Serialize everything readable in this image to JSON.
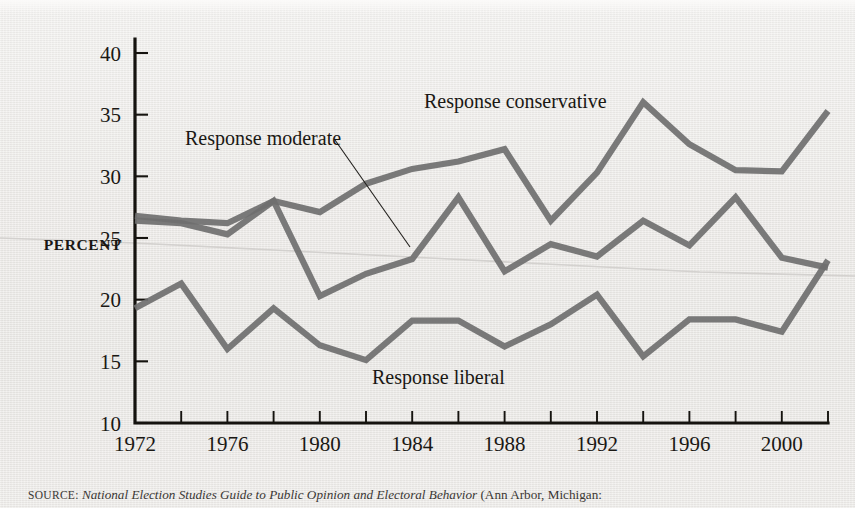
{
  "figure": {
    "axis_title_y": "PERCENT",
    "background_color": "#ebeae7",
    "line_color": "#6f6f6f",
    "axis_color": "#15130f"
  },
  "caption": {
    "source_word": "SOURCE:",
    "title": "National Election Studies Guide to Public Opinion and Electoral Behavior",
    "rest": "(Ann Arbor, Michigan:"
  },
  "labels": {
    "conservative": "Response conservative",
    "moderate": "Response moderate",
    "liberal": "Response liberal"
  },
  "chart_data": {
    "type": "line",
    "title": "",
    "xlabel": "",
    "ylabel": "PERCENT",
    "xlim": [
      1972,
      2002
    ],
    "ylim": [
      10,
      40
    ],
    "ytick_labels": [
      "10",
      "15",
      "20",
      "25",
      "30",
      "35",
      "40"
    ],
    "yticks": [
      10,
      15,
      20,
      25,
      30,
      35,
      40
    ],
    "xtick_labels": [
      "1972",
      "1976",
      "1980",
      "1984",
      "1988",
      "1992",
      "1996",
      "2000"
    ],
    "xticks_labeled": [
      1972,
      1976,
      1980,
      1984,
      1988,
      1992,
      1996,
      2000
    ],
    "xticks_minor": [
      1974,
      1978,
      1982,
      1986,
      1990,
      1994,
      1998,
      2002
    ],
    "grid": false,
    "legend": "inline-annotations",
    "x": [
      1972,
      1974,
      1976,
      1978,
      1980,
      1982,
      1984,
      1986,
      1988,
      1990,
      1992,
      1994,
      1996,
      1998,
      2000,
      2002
    ],
    "series": [
      {
        "name": "Response conservative",
        "values": [
          26.8,
          26.4,
          26.2,
          28.0,
          27.1,
          29.4,
          30.6,
          31.2,
          32.2,
          26.4,
          30.3,
          36.0,
          32.6,
          30.5,
          30.4,
          35.3
        ]
      },
      {
        "name": "Response moderate",
        "values": [
          26.4,
          26.2,
          25.3,
          28.0,
          20.3,
          22.1,
          23.3,
          28.3,
          22.3,
          24.5,
          23.5,
          26.4,
          24.4,
          28.3,
          23.4,
          22.6
        ]
      },
      {
        "name": "Response liberal",
        "values": [
          19.3,
          21.3,
          16.0,
          19.3,
          16.3,
          15.1,
          18.3,
          18.3,
          16.2,
          18.0,
          20.4,
          15.4,
          18.4,
          18.4,
          17.4,
          23.2
        ]
      }
    ]
  }
}
